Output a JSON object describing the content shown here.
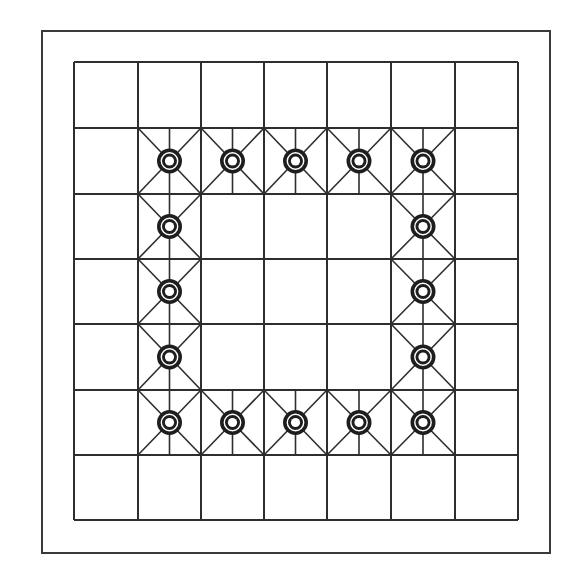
{
  "board": {
    "title": "Board",
    "rows": 7,
    "cols": 7,
    "frame": {
      "x1": 42,
      "y1": 31,
      "x2": 550,
      "y2": 553
    },
    "col_lines": [
      74,
      138,
      201,
      264,
      327,
      391,
      455,
      518
    ],
    "row_lines": [
      62,
      128,
      194,
      259,
      324,
      390,
      455,
      520
    ],
    "colors": {
      "background": "#ffffff",
      "line": "#2e2e2e",
      "frame": "#3a3a3a",
      "piece": "#1e1e1e"
    },
    "piece_icon": "ring-icon",
    "pieces": [
      {
        "row": 1,
        "col": 1
      },
      {
        "row": 1,
        "col": 2
      },
      {
        "row": 1,
        "col": 3
      },
      {
        "row": 1,
        "col": 4
      },
      {
        "row": 1,
        "col": 5
      },
      {
        "row": 2,
        "col": 1
      },
      {
        "row": 2,
        "col": 5
      },
      {
        "row": 3,
        "col": 1
      },
      {
        "row": 3,
        "col": 5
      },
      {
        "row": 4,
        "col": 1
      },
      {
        "row": 4,
        "col": 5
      },
      {
        "row": 5,
        "col": 1
      },
      {
        "row": 5,
        "col": 2
      },
      {
        "row": 5,
        "col": 3
      },
      {
        "row": 5,
        "col": 4
      },
      {
        "row": 5,
        "col": 5
      }
    ]
  }
}
